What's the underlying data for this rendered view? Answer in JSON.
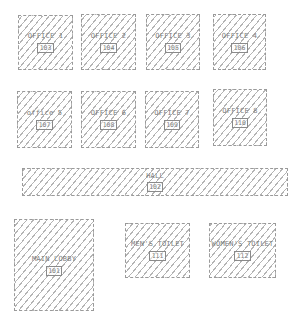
{
  "diagram": {
    "type": "floor-plan",
    "hatch_color": "#b4b4b4",
    "border_color": "#9a9a9a",
    "text_color": "#7d7d7d"
  },
  "rooms": [
    {
      "name": "OFFICE 1",
      "number": "103",
      "x": 18,
      "y": 15,
      "w": 55,
      "h": 55
    },
    {
      "name": "OFFICE 2",
      "number": "104",
      "x": 81,
      "y": 14,
      "w": 55,
      "h": 56
    },
    {
      "name": "OFFICE 3",
      "number": "105",
      "x": 146,
      "y": 14,
      "w": 54,
      "h": 56
    },
    {
      "name": "OFFICE 4",
      "number": "106",
      "x": 213,
      "y": 14,
      "w": 53,
      "h": 56
    },
    {
      "name": "office 5",
      "number": "107",
      "x": 17,
      "y": 91,
      "w": 55,
      "h": 57
    },
    {
      "name": "OFFICE 6",
      "number": "108",
      "x": 81,
      "y": 91,
      "w": 55,
      "h": 57
    },
    {
      "name": "OFFICE 7",
      "number": "109",
      "x": 145,
      "y": 91,
      "w": 54,
      "h": 57
    },
    {
      "name": "OFFICE 8",
      "number": "110",
      "x": 213,
      "y": 89,
      "w": 54,
      "h": 57
    },
    {
      "name": "HALL",
      "number": "102",
      "x": 22,
      "y": 168,
      "w": 266,
      "h": 28
    },
    {
      "name": "MAIN LOBBY",
      "number": "101",
      "x": 14,
      "y": 219,
      "w": 80,
      "h": 92
    },
    {
      "name": "MEN'S TOILET",
      "number": "111",
      "x": 125,
      "y": 223,
      "w": 65,
      "h": 55
    },
    {
      "name": "WOMEN'S TOILET",
      "number": "112",
      "x": 209,
      "y": 223,
      "w": 67,
      "h": 55
    }
  ]
}
